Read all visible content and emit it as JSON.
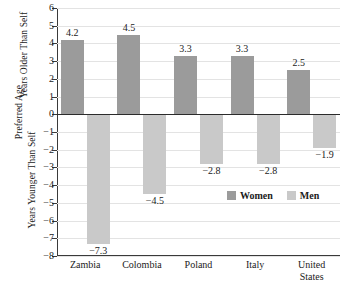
{
  "chart_data": {
    "type": "bar",
    "title": "",
    "xlabel": "",
    "ylabel": "Preferred Age",
    "ylabel_upper": "Years Older Than Self",
    "ylabel_lower": "Years Younger Than Self",
    "ylim": [
      -8,
      6
    ],
    "ytick_labels": [
      "6",
      "5",
      "4",
      "3",
      "2",
      "1",
      "0",
      "−1",
      "−2",
      "−3",
      "−4",
      "−5",
      "−6",
      "−7",
      "−8"
    ],
    "ytick_values": [
      6,
      5,
      4,
      3,
      2,
      1,
      0,
      -1,
      -2,
      -3,
      -4,
      -5,
      -6,
      -7,
      -8
    ],
    "grid": true,
    "legend_position": "inside-lower-right",
    "categories": [
      "Zambia",
      "Colombia",
      "Poland",
      "Italy",
      "United\nStates"
    ],
    "series": [
      {
        "name": "Women",
        "color": "#9b9b9b",
        "values": [
          4.2,
          4.5,
          3.3,
          3.3,
          2.5
        ],
        "labels": [
          "4.2",
          "4.5",
          "3.3",
          "3.3",
          "2.5"
        ]
      },
      {
        "name": "Men",
        "color": "#c9c9c9",
        "values": [
          -7.3,
          -4.5,
          -2.8,
          -2.8,
          -1.9
        ],
        "labels": [
          "−7.3",
          "−4.5",
          "−2.8",
          "−2.8",
          "−1.9"
        ]
      }
    ]
  },
  "legend": {
    "items": [
      {
        "label": "Women",
        "color": "#9b9b9b"
      },
      {
        "label": "Men",
        "color": "#c9c9c9"
      }
    ]
  }
}
